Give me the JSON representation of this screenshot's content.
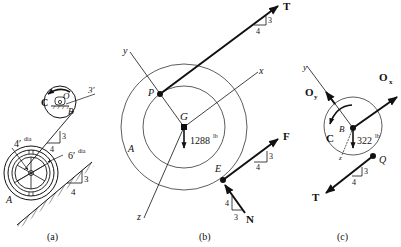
{
  "panel_a": {
    "caption": "(a)",
    "labels": {
      "C": "C",
      "O": "O",
      "B": "B",
      "A": "A",
      "length": "3′",
      "inner_dia": "4′",
      "inner_dia_suffix": "dia",
      "outer_dia": "6′",
      "outer_dia_suffix": "dia"
    },
    "slope_cable": {
      "rise": "3",
      "run": "4"
    },
    "slope_incline": {
      "rise": "3",
      "run": "4"
    }
  },
  "panel_b": {
    "caption": "(b)",
    "labels": {
      "y": "y",
      "x": "x",
      "z": "z",
      "P": "P",
      "G": "G",
      "A": "A",
      "E": "E",
      "T": "T",
      "F": "F",
      "N": "N"
    },
    "weight": {
      "value": "1288",
      "unit": "lb"
    },
    "slope_T": {
      "rise": "3",
      "run": "4"
    },
    "slope_F": {
      "rise": "3",
      "run": "4"
    },
    "slope_N": {
      "rise": "4",
      "run": "3"
    }
  },
  "panel_c": {
    "caption": "(c)",
    "labels": {
      "y": "y",
      "z": "z",
      "Oy": "O",
      "Oy_sub": "y",
      "Ox": "O",
      "Ox_sub": "x",
      "C": "C",
      "B": "B",
      "Q": "Q",
      "T": "T"
    },
    "weight": {
      "value": "322",
      "unit": "lb"
    },
    "slope_T": {
      "rise": "3",
      "run": "4"
    }
  }
}
